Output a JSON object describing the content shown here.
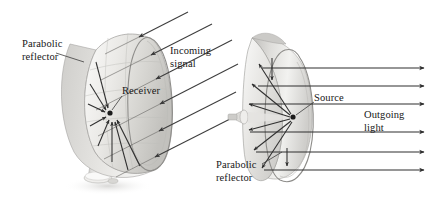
{
  "figure": {
    "background_color": "#ffffff",
    "ink_color": "#2b2b2b",
    "dish_light": "#f2f1ef",
    "dish_mid": "#d8d7d4",
    "dish_dark": "#b4b3b0"
  },
  "panels": [
    {
      "id": "receiving-dish",
      "name": "satellite-dish-panel",
      "description": "Tilted parabolic satellite dish on a pedestal collecting incoming parallel signal rays to a focal receiver",
      "labels": {
        "reflector_line1": "Parabolic",
        "reflector_line2": "reflector",
        "incoming_line1": "Incoming",
        "incoming_line2": "signal",
        "receiver": "Receiver"
      },
      "ray_count": 6,
      "ray_direction": "inward",
      "ray_angle_deg": 27,
      "focus": {
        "x": 110,
        "y": 113
      },
      "has_pedestal": true
    },
    {
      "id": "emitting-reflector",
      "name": "spotlight-reflector-panel",
      "description": "Parabolic reflector with a point source at the focus emitting rays that reflect into parallel outgoing light",
      "labels": {
        "source": "Source",
        "outgoing_line1": "Outgoing",
        "outgoing_line2": "light",
        "reflector_line1": "Parabolic",
        "reflector_line2": "reflector"
      },
      "ray_count": 6,
      "ray_direction": "outward",
      "ray_angle_deg": 0,
      "focus": {
        "x": 293,
        "y": 117
      },
      "has_pedestal": false
    }
  ]
}
